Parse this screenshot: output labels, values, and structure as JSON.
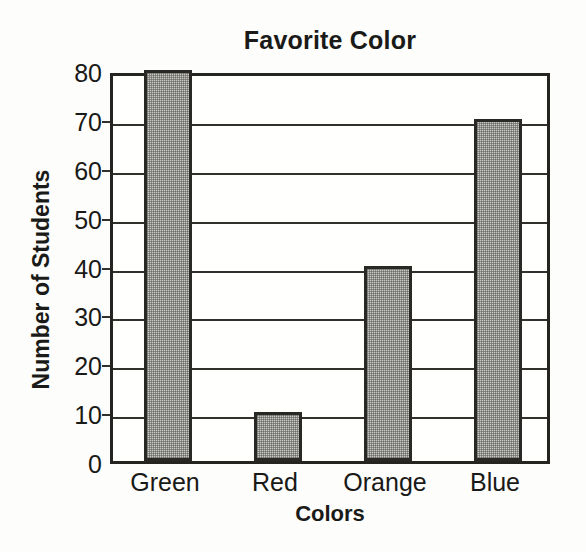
{
  "chart_data": {
    "type": "bar",
    "title": "Favorite Color",
    "xlabel": "Colors",
    "ylabel": "Number of Students",
    "categories": [
      "Green",
      "Red",
      "Orange",
      "Blue"
    ],
    "values": [
      80,
      10,
      40,
      70
    ],
    "ylim": [
      0,
      80
    ],
    "ytick_labels": [
      "0",
      "10",
      "20",
      "30",
      "40",
      "50",
      "60",
      "70",
      "80"
    ],
    "ytick_values": [
      0,
      10,
      20,
      30,
      40,
      50,
      60,
      70,
      80
    ],
    "ytick_step": 10,
    "grid": true,
    "grid_axis": "y",
    "legend": false,
    "legend_position": "none",
    "bar_fill": "#c9c9c6",
    "bar_fill_style": "stippled-gray-halftone",
    "bar_border_color": "#2a2824",
    "axis_color": "#262420",
    "text_color": "#191917",
    "background": "#fdfdfb"
  }
}
